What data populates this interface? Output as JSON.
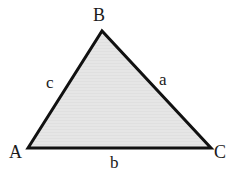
{
  "figure": {
    "type": "geometry-diagram",
    "shape": "triangle",
    "background_color": "#ffffff",
    "fill_color": "#e4e4e4",
    "stroke_color": "#111111",
    "stroke_width": 3
  },
  "triangle": {
    "vertices": [
      {
        "name": "A",
        "label": "A",
        "x": 28,
        "y": 148
      },
      {
        "name": "B",
        "label": "B",
        "x": 102,
        "y": 31
      },
      {
        "name": "C",
        "label": "C",
        "x": 211,
        "y": 148
      }
    ],
    "sides": [
      {
        "name": "a",
        "label": "a",
        "between": "B-C"
      },
      {
        "name": "b",
        "label": "b",
        "between": "A-C"
      },
      {
        "name": "c",
        "label": "c",
        "between": "A-B"
      }
    ],
    "polygon_points": "28,148 102,31 211,148"
  }
}
